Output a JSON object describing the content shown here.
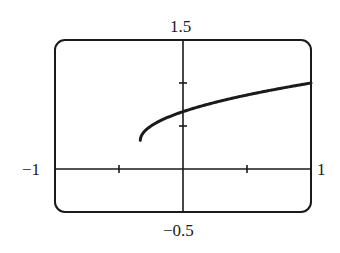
{
  "chart_data": {
    "type": "line",
    "title": "",
    "xlabel": "",
    "ylabel": "",
    "xlim": [
      -1,
      1
    ],
    "ylim": [
      -0.5,
      1.5
    ],
    "window_labels": {
      "xmin": "−1",
      "xmax": "1",
      "ymin": "−0.5",
      "ymax": "1.5"
    },
    "x_ticks": [
      -0.5,
      0.5
    ],
    "y_ticks": [
      0.5,
      1.0
    ],
    "grid": false,
    "series": [
      {
        "name": "curve",
        "x": [
          -0.333,
          -0.3,
          -0.25,
          -0.2,
          -0.1,
          0.0,
          0.1,
          0.2,
          0.4,
          0.6,
          0.8,
          1.0
        ],
        "y": [
          0.333,
          0.439,
          0.5,
          0.544,
          0.713,
          0.667,
          0.713,
          0.755,
          0.827,
          0.891,
          0.949,
          1.0
        ]
      }
    ],
    "style": {
      "line_color": "#1a1a1a",
      "frame_color": "#1a1a1a"
    }
  }
}
